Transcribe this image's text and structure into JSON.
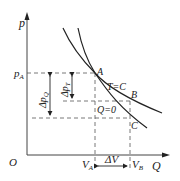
{
  "diagram": {
    "type": "p-V thermodynamic diagram",
    "axes": {
      "y_label": "p",
      "x_label": "Q",
      "origin_label": "O"
    },
    "points": {
      "A": "A",
      "B": "B",
      "C": "C"
    },
    "curves": {
      "isotherm_label": "T=C",
      "adiabat_label": "Q=0"
    },
    "ticks": {
      "pA": {
        "main": "p",
        "sub": "A"
      },
      "VA": {
        "main": "V",
        "sub": "A"
      },
      "VB": {
        "main": "V",
        "sub": "B"
      }
    },
    "dimensions": {
      "delta_pQ": {
        "main": "Δp",
        "sub": "Q"
      },
      "delta_pT": {
        "main": "Δp",
        "sub": "T"
      },
      "delta_V": "ΔV"
    },
    "colors": {
      "line": "#222222",
      "dash": "#555555",
      "axis": "#444444"
    }
  }
}
